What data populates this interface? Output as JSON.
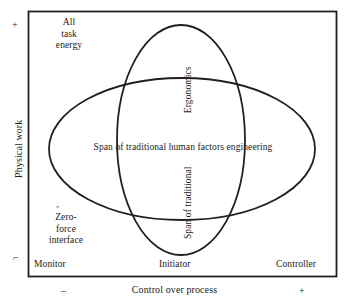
{
  "figure": {
    "type": "venn-diagram",
    "frame": {
      "stroke": "#231f20",
      "fill": "#ffffff"
    }
  },
  "axes": {
    "y": {
      "title": "Physical work",
      "plus_mark": "+",
      "minus_mark": "⌐",
      "high_label": "All\ntask\nenergy",
      "high_label_text": "All task energy",
      "low_label": "Zero-\nforce\ninterface",
      "low_label_text": "Zero- force interface",
      "low_label_tick": "\""
    },
    "x": {
      "title": "Control over process",
      "minus_mark": "–",
      "plus_mark": "+",
      "categories": [
        "Monitor",
        "Initiator",
        "Controller"
      ]
    }
  },
  "regions": [
    {
      "name": "span-of-traditional-human-factors-engineering",
      "label": "Span of traditional human factors engineering",
      "shape": "horizontal-ellipse",
      "orientation": "horizontal",
      "cx": 182,
      "cy": 149,
      "rx": 133,
      "ry": 71
    },
    {
      "name": "ergonomics",
      "label": "Ergonomics",
      "shape": "vertical-ellipse",
      "orientation": "vertical",
      "cx": 181,
      "cy": 140,
      "rx": 64,
      "ry": 115
    },
    {
      "name": "span-of-traditional",
      "label": "Span of traditional",
      "shape": "vertical-ellipse",
      "orientation": "vertical"
    }
  ],
  "labels": {
    "all_task_energy": "All\ntask\nenergy",
    "all_task_energy_lines": [
      "All",
      "task",
      "energy"
    ],
    "zero_force_interface_lines": [
      "Zero-",
      "force",
      "interface"
    ],
    "ergonomics": "Ergonomics",
    "span_of_traditional": "Span of traditional",
    "span_of_traditional_hfe": "Span of traditional human factors engineering",
    "monitor": "Monitor",
    "initiator": "Initiator",
    "controller": "Controller",
    "physical_work": "Physical work",
    "control_over_process": "Control over process",
    "plus": "+",
    "minus": "–",
    "y_minus_tick": "⌐",
    "zero_tick": "\""
  },
  "colors": {
    "line": "#231f20",
    "text": "#1a1a1a",
    "background": "#ffffff"
  }
}
